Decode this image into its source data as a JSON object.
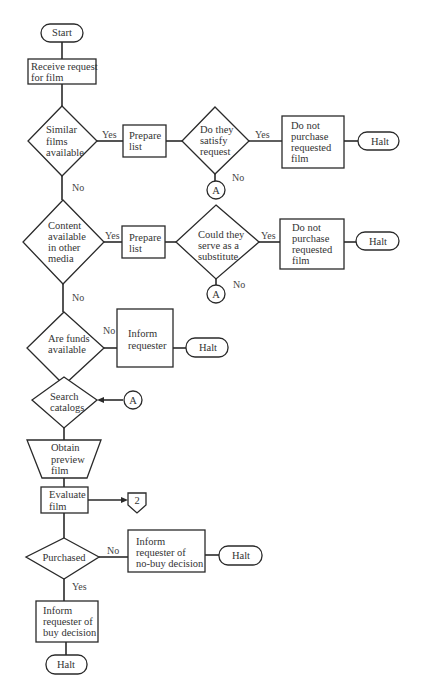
{
  "diagram": {
    "type": "flowchart",
    "nodes": [
      {
        "id": "start",
        "shape": "terminal",
        "lines": [
          "Start"
        ]
      },
      {
        "id": "receive",
        "shape": "process",
        "lines": [
          "Receive request",
          "for film"
        ]
      },
      {
        "id": "similar",
        "shape": "decision",
        "lines": [
          "Similar",
          "films",
          "available"
        ]
      },
      {
        "id": "prep1",
        "shape": "process",
        "lines": [
          "Prepare",
          "list"
        ]
      },
      {
        "id": "satisfy",
        "shape": "decision",
        "lines": [
          "Do they",
          "satisfy",
          "request"
        ]
      },
      {
        "id": "nopurch1",
        "shape": "process",
        "lines": [
          "Do not",
          "purchase",
          "requested",
          "film"
        ]
      },
      {
        "id": "halt1",
        "shape": "terminal",
        "lines": [
          "Halt"
        ]
      },
      {
        "id": "connA1",
        "shape": "connector",
        "lines": [
          "A"
        ]
      },
      {
        "id": "content",
        "shape": "decision",
        "lines": [
          "Content",
          "available",
          "in other",
          "media"
        ]
      },
      {
        "id": "prep2",
        "shape": "process",
        "lines": [
          "Prepare",
          "list"
        ]
      },
      {
        "id": "substitute",
        "shape": "decision",
        "lines": [
          "Could they",
          "serve as a",
          "substitute"
        ]
      },
      {
        "id": "nopurch2",
        "shape": "process",
        "lines": [
          "Do not",
          "purchase",
          "requested",
          "film"
        ]
      },
      {
        "id": "halt2",
        "shape": "terminal",
        "lines": [
          "Halt"
        ]
      },
      {
        "id": "connA2",
        "shape": "connector",
        "lines": [
          "A"
        ]
      },
      {
        "id": "funds",
        "shape": "decision",
        "lines": [
          "Are funds",
          "available"
        ]
      },
      {
        "id": "inform1",
        "shape": "process",
        "lines": [
          "Inform",
          "requester"
        ]
      },
      {
        "id": "halt3",
        "shape": "terminal",
        "lines": [
          "Halt"
        ]
      },
      {
        "id": "search",
        "shape": "decision",
        "lines": [
          "Search",
          "catalogs"
        ]
      },
      {
        "id": "connA3",
        "shape": "connector",
        "lines": [
          "A"
        ]
      },
      {
        "id": "preview",
        "shape": "manual-operation",
        "lines": [
          "Obtain",
          "preview",
          "film"
        ]
      },
      {
        "id": "evaluate",
        "shape": "process",
        "lines": [
          "Evaluate",
          "film"
        ]
      },
      {
        "id": "offpage2",
        "shape": "off-page-connector",
        "lines": [
          "2"
        ]
      },
      {
        "id": "purchased",
        "shape": "decision",
        "lines": [
          "Purchased"
        ]
      },
      {
        "id": "informNo",
        "shape": "process",
        "lines": [
          "Inform",
          "requester of",
          "no-buy decision"
        ]
      },
      {
        "id": "halt4",
        "shape": "terminal",
        "lines": [
          "Halt"
        ]
      },
      {
        "id": "informBuy",
        "shape": "process",
        "lines": [
          "Inform",
          "requester of",
          "buy decision"
        ]
      },
      {
        "id": "halt5",
        "shape": "terminal",
        "lines": [
          "Halt"
        ]
      }
    ],
    "edges": [
      {
        "from": "start",
        "to": "receive",
        "label": ""
      },
      {
        "from": "receive",
        "to": "similar",
        "label": ""
      },
      {
        "from": "similar",
        "to": "prep1",
        "label": "Yes"
      },
      {
        "from": "prep1",
        "to": "satisfy",
        "label": ""
      },
      {
        "from": "satisfy",
        "to": "nopurch1",
        "label": "Yes"
      },
      {
        "from": "nopurch1",
        "to": "halt1",
        "label": ""
      },
      {
        "from": "satisfy",
        "to": "connA1",
        "label": "No"
      },
      {
        "from": "similar",
        "to": "content",
        "label": "No"
      },
      {
        "from": "content",
        "to": "prep2",
        "label": "Yes"
      },
      {
        "from": "prep2",
        "to": "substitute",
        "label": ""
      },
      {
        "from": "substitute",
        "to": "nopurch2",
        "label": "Yes"
      },
      {
        "from": "nopurch2",
        "to": "halt2",
        "label": ""
      },
      {
        "from": "substitute",
        "to": "connA2",
        "label": "No"
      },
      {
        "from": "content",
        "to": "funds",
        "label": "No"
      },
      {
        "from": "funds",
        "to": "inform1",
        "label": "No"
      },
      {
        "from": "inform1",
        "to": "halt3",
        "label": ""
      },
      {
        "from": "funds",
        "to": "search",
        "label": ""
      },
      {
        "from": "connA3",
        "to": "search",
        "label": ""
      },
      {
        "from": "search",
        "to": "preview",
        "label": ""
      },
      {
        "from": "preview",
        "to": "evaluate",
        "label": ""
      },
      {
        "from": "evaluate",
        "to": "offpage2",
        "label": ""
      },
      {
        "from": "evaluate",
        "to": "purchased",
        "label": ""
      },
      {
        "from": "purchased",
        "to": "informNo",
        "label": "No"
      },
      {
        "from": "informNo",
        "to": "halt4",
        "label": ""
      },
      {
        "from": "purchased",
        "to": "informBuy",
        "label": "Yes"
      },
      {
        "from": "informBuy",
        "to": "halt5",
        "label": ""
      }
    ]
  },
  "labels": {
    "start": "Start",
    "receive_1": "Receive request",
    "receive_2": "for film",
    "similar_1": "Similar",
    "similar_2": "films",
    "similar_3": "available",
    "prep1_1": "Prepare",
    "prep1_2": "list",
    "satisfy_1": "Do they",
    "satisfy_2": "satisfy",
    "satisfy_3": "request",
    "nopurch1_1": "Do not",
    "nopurch1_2": "purchase",
    "nopurch1_3": "requested",
    "nopurch1_4": "film",
    "halt1": "Halt",
    "connA1": "A",
    "content_1": "Content",
    "content_2": "available",
    "content_3": "in other",
    "content_4": "media",
    "prep2_1": "Prepare",
    "prep2_2": "list",
    "substitute_1": "Could they",
    "substitute_2": "serve as a",
    "substitute_3": "substitute",
    "nopurch2_1": "Do not",
    "nopurch2_2": "purchase",
    "nopurch2_3": "requested",
    "nopurch2_4": "film",
    "halt2": "Halt",
    "connA2": "A",
    "funds_1": "Are funds",
    "funds_2": "available",
    "inform1_1": "Inform",
    "inform1_2": "requester",
    "halt3": "Halt",
    "search_1": "Search",
    "search_2": "catalogs",
    "connA3": "A",
    "preview_1": "Obtain",
    "preview_2": "preview",
    "preview_3": "film",
    "evaluate_1": "Evaluate",
    "evaluate_2": "film",
    "offpage2": "2",
    "purchased": "Purchased",
    "informNo_1": "Inform",
    "informNo_2": "requester of",
    "informNo_3": "no-buy decision",
    "halt4": "Halt",
    "informBuy_1": "Inform",
    "informBuy_2": "requester of",
    "informBuy_3": "buy decision",
    "halt5": "Halt"
  },
  "edge_labels": {
    "similar_yes": "Yes",
    "satisfy_yes": "Yes",
    "satisfy_no": "No",
    "similar_no": "No",
    "content_yes": "Yes",
    "substitute_yes": "Yes",
    "substitute_no": "No",
    "content_no": "No",
    "funds_no": "No",
    "purchased_no": "No",
    "purchased_yes": "Yes"
  },
  "colors": {
    "stroke": "#2a2a2a",
    "text": "#333333",
    "background": "#ffffff"
  }
}
